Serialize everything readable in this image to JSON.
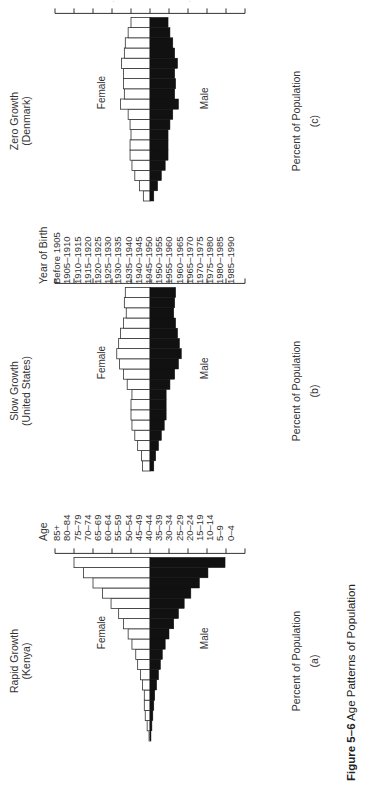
{
  "figure": {
    "caption_label": "Figure 5–6",
    "caption_text": "Age Patterns of Population",
    "orientation_note": "rotated 90 degrees counterclockwise on page"
  },
  "labels": {
    "age_header": "Age",
    "ages": [
      "85+",
      "80–84",
      "75–79",
      "70–74",
      "65–69",
      "60–64",
      "55–59",
      "50–54",
      "45–49",
      "40–44",
      "35–39",
      "30–34",
      "25–29",
      "20–24",
      "15–19",
      "10–14",
      "5–9",
      "0–4"
    ],
    "birth_header": "Year of Birth",
    "births": [
      "Before 1905",
      "1905–1910",
      "1910–1915",
      "1915–1920",
      "1920–1925",
      "1925–1930",
      "1930–1935",
      "1935–1940",
      "1940–1945",
      "1945–1950",
      "1950–1955",
      "1955–1960",
      "1960–1965",
      "1965–1970",
      "1970–1975",
      "1975–1980",
      "1980–1985",
      "1985–1990"
    ]
  },
  "panels": [
    {
      "title_line1": "Rapid Growth",
      "title_line2": "(Kenya)",
      "xlabel": "Percent of Population",
      "letter": "(a)",
      "female_label": "Female",
      "male_label": "Male"
    },
    {
      "title_line1": "Slow Growth",
      "title_line2": "(United States)",
      "xlabel": "Percent of Population",
      "letter": "(b)",
      "female_label": "Female",
      "male_label": "Male"
    },
    {
      "title_line1": "Zero Growth",
      "title_line2": "(Denmark)",
      "xlabel": "Percent of Population",
      "letter": "(c)",
      "female_label": "Female",
      "male_label": "Male"
    }
  ],
  "chart_data": [
    {
      "type": "bar",
      "subtype": "population-pyramid",
      "title": "Rapid Growth (Kenya)",
      "xlabel": "Percent of Population",
      "panel_letter": "(a)",
      "categories": [
        "85+",
        "80–84",
        "75–79",
        "70–74",
        "65–69",
        "60–64",
        "55–59",
        "50–54",
        "45–49",
        "40–44",
        "35–39",
        "30–34",
        "25–29",
        "20–24",
        "15–19",
        "10–14",
        "5–9",
        "0–4"
      ],
      "series": [
        {
          "name": "Male",
          "color": "#111111",
          "values": [
            0.1,
            0.2,
            0.3,
            0.4,
            0.5,
            0.7,
            0.9,
            1.1,
            1.3,
            1.6,
            2.0,
            2.5,
            3.0,
            3.6,
            4.3,
            5.2,
            6.1,
            7.9
          ]
        },
        {
          "name": "Female",
          "color": "#ffffff",
          "values": [
            0.1,
            0.3,
            0.5,
            0.6,
            0.6,
            0.8,
            1.0,
            1.3,
            1.5,
            1.9,
            2.3,
            2.8,
            3.3,
            4.1,
            5.0,
            6.0,
            7.0,
            8.0
          ]
        }
      ],
      "xticks": [
        10,
        8,
        6,
        4,
        2,
        0,
        2,
        4,
        6,
        8,
        10
      ],
      "xlim": [
        -10,
        10
      ],
      "grid": false
    },
    {
      "type": "bar",
      "subtype": "population-pyramid",
      "title": "Slow Growth (United States)",
      "xlabel": "Percent of Population",
      "panel_letter": "(b)",
      "categories": [
        "85+",
        "80–84",
        "75–79",
        "70–74",
        "65–69",
        "60–64",
        "55–59",
        "50–54",
        "45–49",
        "40–44",
        "35–39",
        "30–34",
        "25–29",
        "20–24",
        "15–19",
        "10–14",
        "5–9",
        "0–4"
      ],
      "series": [
        {
          "name": "Male",
          "color": "#111111",
          "values": [
            0.4,
            0.6,
            0.9,
            1.2,
            1.5,
            1.7,
            1.7,
            1.7,
            2.1,
            2.6,
            3.0,
            3.3,
            3.1,
            2.9,
            2.7,
            2.5,
            2.6,
            2.7
          ]
        },
        {
          "name": "Female",
          "color": "#ffffff",
          "values": [
            0.8,
            0.9,
            1.3,
            1.6,
            1.9,
            2.0,
            2.0,
            1.9,
            2.4,
            2.8,
            3.2,
            3.5,
            3.3,
            3.1,
            2.8,
            2.5,
            2.7,
            2.6
          ]
        }
      ],
      "xticks": [
        10,
        8,
        6,
        4,
        2,
        0,
        2,
        4,
        6,
        8,
        10
      ],
      "xlim": [
        -10,
        10
      ],
      "grid": false
    },
    {
      "type": "bar",
      "subtype": "population-pyramid",
      "title": "Zero Growth (Denmark)",
      "xlabel": "Percent of Population",
      "panel_letter": "(c)",
      "categories": [
        "Before 1905",
        "1905–1910",
        "1910–1915",
        "1915–1920",
        "1920–1925",
        "1925–1930",
        "1930–1935",
        "1935–1940",
        "1940–1945",
        "1945–1950",
        "1950–1955",
        "1955–1960",
        "1960–1965",
        "1965–1970",
        "1970–1975",
        "1975–1980",
        "1980–1985",
        "1985–1990"
      ],
      "series": [
        {
          "name": "Male",
          "color": "#111111",
          "values": [
            0.4,
            0.8,
            1.2,
            1.6,
            1.9,
            1.9,
            1.9,
            2.1,
            2.4,
            3.0,
            2.6,
            2.7,
            2.6,
            2.9,
            2.6,
            2.4,
            2.1,
            1.9
          ]
        },
        {
          "name": "Female",
          "color": "#ffffff",
          "values": [
            0.7,
            1.1,
            1.6,
            1.9,
            2.1,
            2.1,
            2.0,
            2.1,
            2.3,
            3.1,
            2.7,
            2.8,
            2.8,
            3.0,
            2.7,
            2.6,
            2.3,
            2.0
          ]
        }
      ],
      "xticks": [
        10,
        8,
        6,
        4,
        2,
        0,
        2,
        4,
        6,
        8,
        10
      ],
      "xlim": [
        -10,
        10
      ],
      "grid": false
    }
  ]
}
